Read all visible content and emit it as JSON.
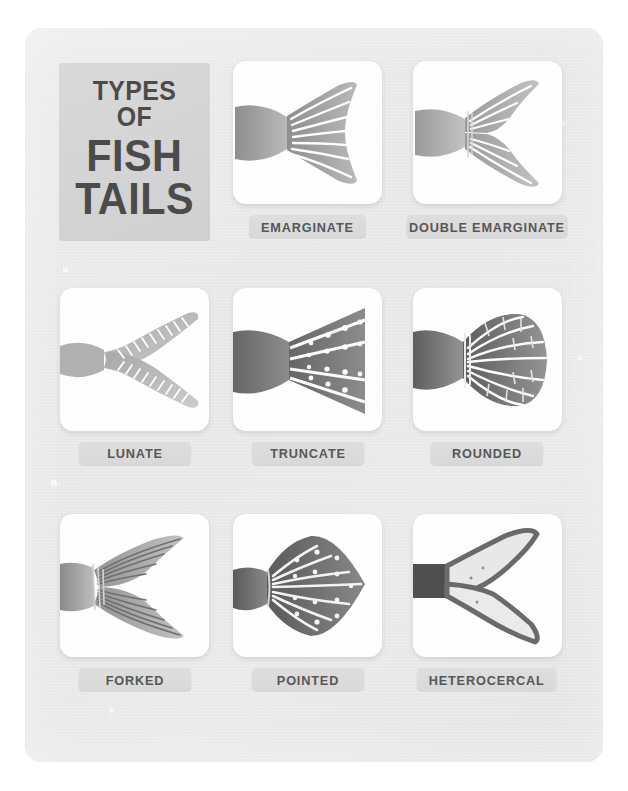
{
  "poster": {
    "title_lines": [
      "TYPES OF",
      "FISH",
      "TAILS"
    ],
    "background_color": "#e9e9e9",
    "card_color": "#fefefe",
    "pill_color": "#dcdcdc",
    "text_color": "#4b4b4b",
    "illustration_color": "#9a9a9a"
  },
  "items": [
    {
      "label": "EMARGINATE",
      "icon": "emarginate-tail-icon"
    },
    {
      "label": "DOUBLE EMARGINATE",
      "icon": "double-emarginate-tail-icon"
    },
    {
      "label": "LUNATE",
      "icon": "lunate-tail-icon"
    },
    {
      "label": "TRUNCATE",
      "icon": "truncate-tail-icon"
    },
    {
      "label": "ROUNDED",
      "icon": "rounded-tail-icon"
    },
    {
      "label": "FORKED",
      "icon": "forked-tail-icon"
    },
    {
      "label": "POINTED",
      "icon": "pointed-tail-icon"
    },
    {
      "label": "HETEROCERCAL",
      "icon": "heterocercal-tail-icon"
    }
  ]
}
